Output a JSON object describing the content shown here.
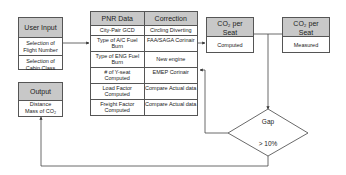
{
  "user_input": {
    "title": "User Input",
    "items": [
      "Selection of Flight Number",
      "Selection of Cabin Class"
    ]
  },
  "pnr_table": {
    "headers": [
      "PNR Data",
      "Correction"
    ],
    "rows": [
      [
        "City-Pair GCD",
        "Circling Diverting"
      ],
      [
        "Type of A/C Fuel Burn",
        "FAA/SAGA Corinair"
      ],
      [
        "Type of ENG Fuel Burn",
        "New engine"
      ],
      [
        "# of Y-seat Computed",
        "EMEP Corinair"
      ],
      [
        "Load Factor Computed",
        "Compare Actual data"
      ],
      [
        "Freight Factor Computed",
        "Compare Actual data"
      ]
    ]
  },
  "co2_computed": {
    "title": "CO₂ per Seat",
    "value": "Computed"
  },
  "co2_measured": {
    "title": "CO₂ per Seat",
    "value": "Measured"
  },
  "output": {
    "title": "Output",
    "items": [
      "Distance",
      "Mass of CO₂"
    ]
  },
  "gap": {
    "label": "Gap",
    "condition": "> 10%"
  }
}
